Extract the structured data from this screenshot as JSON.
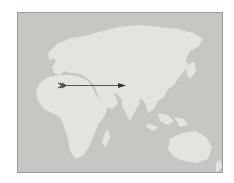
{
  "map": {
    "title": "",
    "region": "Eastern Hemisphere (Africa, Europe, Asia, Australia)",
    "colors": {
      "water": "#c6c6c2",
      "land": "#e3e3df",
      "frame": "#9a9a96",
      "arrow": "#555555"
    },
    "arrow": {
      "from": "North Africa / Sahara",
      "to": "Northern India",
      "direction": "eastward",
      "tail_style": "feathered"
    }
  }
}
